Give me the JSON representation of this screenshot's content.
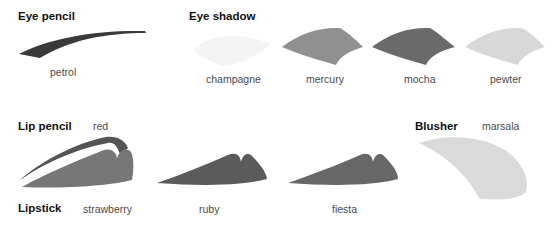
{
  "sections": {
    "eye_pencil": {
      "heading": "Eye pencil",
      "swatches": [
        {
          "name": "petrol",
          "color": "#3a3a3a"
        }
      ]
    },
    "eye_shadow": {
      "heading": "Eye shadow",
      "swatches": [
        {
          "name": "champagne",
          "color": "#f6f6f6"
        },
        {
          "name": "mercury",
          "color": "#8f8f8f"
        },
        {
          "name": "mocha",
          "color": "#6a6a6a"
        },
        {
          "name": "pewter",
          "color": "#d6d6d6"
        }
      ]
    },
    "lip_pencil": {
      "heading": "Lip pencil",
      "swatches": [
        {
          "name": "red",
          "color": "#5a5a5a"
        }
      ]
    },
    "lipstick": {
      "heading": "Lipstick",
      "swatches": [
        {
          "name": "strawberry",
          "color": "#777777"
        },
        {
          "name": "ruby",
          "color": "#5b5b5b"
        },
        {
          "name": "fiesta",
          "color": "#676767"
        }
      ]
    },
    "blusher": {
      "heading": "Blusher",
      "swatches": [
        {
          "name": "marsala",
          "color": "#dadada"
        }
      ]
    }
  }
}
